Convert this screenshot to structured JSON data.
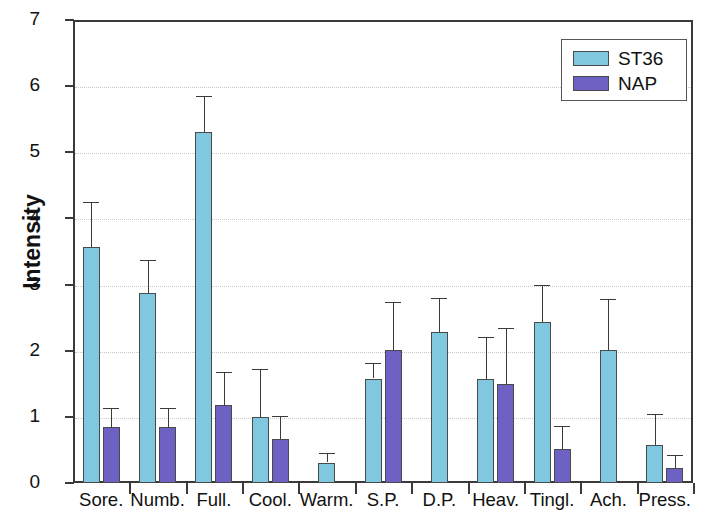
{
  "chart_data": {
    "type": "bar",
    "title": "",
    "xlabel": "",
    "ylabel": "Intensity",
    "ylim": [
      0,
      7
    ],
    "yticks": [
      0,
      1,
      2,
      3,
      4,
      5,
      6,
      7
    ],
    "grid": true,
    "legend_position": "top-right",
    "categories": [
      "Sore.",
      "Numb.",
      "Full.",
      "Cool.",
      "Warm.",
      "S.P.",
      "D.P.",
      "Heav.",
      "Tingl.",
      "Ach.",
      "Press."
    ],
    "series": [
      {
        "name": "ST36",
        "color": "#7fc8e0",
        "values": [
          3.57,
          2.87,
          5.3,
          1.0,
          0.31,
          1.58,
          2.28,
          1.57,
          2.43,
          2.01,
          0.58
        ],
        "error_upper": [
          4.25,
          3.37,
          5.85,
          1.72,
          0.46,
          1.82,
          2.8,
          2.2,
          3.0,
          2.78,
          1.05
        ]
      },
      {
        "name": "NAP",
        "color": "#6d62c4",
        "values": [
          0.84,
          0.84,
          1.18,
          0.67,
          null,
          2.01,
          null,
          1.5,
          0.52,
          null,
          0.23
        ],
        "error_upper": [
          1.14,
          1.13,
          1.68,
          1.02,
          null,
          2.74,
          null,
          2.35,
          0.86,
          null,
          0.42
        ]
      }
    ]
  },
  "legend": {
    "entries": [
      {
        "label": "ST36",
        "color": "#7fc8e0"
      },
      {
        "label": "NAP",
        "color": "#6d62c4"
      }
    ]
  },
  "axes": {
    "y_title": "Intensity",
    "y_tick_labels": [
      "7",
      "6",
      "5",
      "4",
      "3",
      "2",
      "1",
      "0"
    ],
    "x_tick_labels": [
      "Sore.",
      "Numb.",
      "Full.",
      "Cool.",
      "Warm.",
      "S.P.",
      "D.P.",
      "Heav.",
      "Tingl.",
      "Ach.",
      "Press."
    ]
  }
}
